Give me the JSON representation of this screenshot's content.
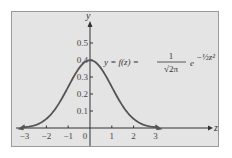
{
  "chart_data": {
    "type": "line",
    "title": "",
    "xlabel": "z",
    "ylabel": "y",
    "equation": {
      "lhs": "y = f(z) =",
      "numerator": "1",
      "denominator": "√2π",
      "base": "e",
      "exponent": "−½z²"
    },
    "x_ticks": [
      -3,
      -2,
      -1,
      0,
      1,
      2,
      3
    ],
    "x_tick_labels": [
      "−3",
      "−2",
      "−1",
      "0",
      "1",
      "2",
      "3"
    ],
    "y_ticks": [
      0.1,
      0.2,
      0.3,
      0.4,
      0.5
    ],
    "y_tick_labels": [
      "0.1",
      "0.2",
      "0.3",
      "0.4",
      "0.5"
    ],
    "xlim": [
      -3.4,
      5.9
    ],
    "ylim": [
      0,
      0.6
    ],
    "grid": false,
    "legend": null,
    "series": [
      {
        "name": "standard normal density",
        "function": "exp(-z^2/2)/sqrt(2*pi)",
        "x": [
          -3.4,
          -3,
          -2.5,
          -2,
          -1.5,
          -1,
          -0.5,
          0,
          0.5,
          1,
          1.5,
          2,
          2.5,
          3,
          3.4
        ],
        "values": [
          0.0012,
          0.0044,
          0.0175,
          0.054,
          0.1295,
          0.242,
          0.3521,
          0.3989,
          0.3521,
          0.242,
          0.1295,
          0.054,
          0.0175,
          0.0044,
          0.0012
        ]
      }
    ],
    "colors": {
      "curve": "#555555",
      "axes": "#333333",
      "panel": "#e4e4e4"
    }
  }
}
